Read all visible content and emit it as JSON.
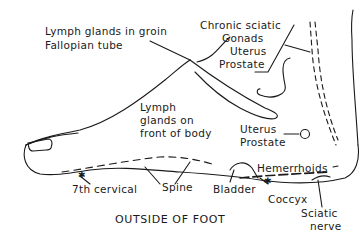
{
  "caption": "OUTSIDE OF FOOT",
  "labels": {
    "lymph_groin": "Lymph glands in groin",
    "fallopian": "Fallopian tube",
    "chronic_sciatic": "Chronic sciatic",
    "gonads": "Gonads",
    "uterus_top": "Uterus",
    "prostate_top": "Prostate",
    "lymph_front_1": "Lymph",
    "lymph_front_2": "glands on",
    "lymph_front_3": "front of body",
    "uterus_mid": "Uterus",
    "prostate_mid": "Prostate",
    "hemorrhoids": "Hemerrhoids",
    "seventh_cervical": "7th cervical",
    "spine": "Spine",
    "bladder": "Bladder",
    "coccyx": "Coccyx",
    "sciatic_1": "Sciatic",
    "sciatic_2": "nerve"
  },
  "colors": {
    "ink": "#1a1a1a",
    "background": "#ffffff"
  }
}
